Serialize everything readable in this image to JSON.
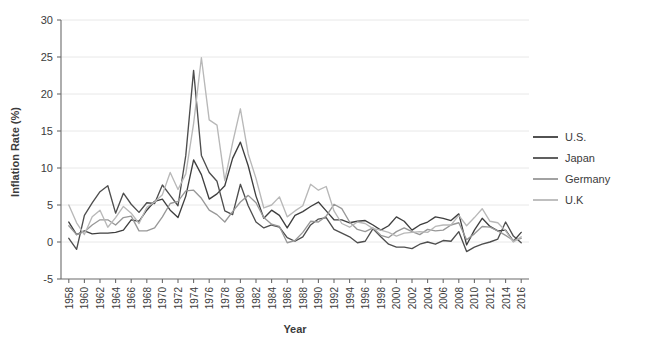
{
  "chart_data": {
    "type": "line",
    "title": "",
    "xlabel": "Year",
    "ylabel": "Inflation Rate (%)",
    "xlim": [
      1957,
      2017
    ],
    "ylim": [
      -5,
      30
    ],
    "grid": true,
    "legend_position": "right",
    "y_ticks": [
      -5,
      0,
      5,
      10,
      15,
      20,
      25,
      30
    ],
    "y_tick_labels": [
      "-5",
      "0",
      "5",
      "10",
      "15",
      "20",
      "25",
      "30"
    ],
    "x_ticks": [
      1958,
      1960,
      1962,
      1964,
      1966,
      1968,
      1970,
      1972,
      1974,
      1976,
      1978,
      1980,
      1982,
      1984,
      1986,
      1988,
      1990,
      1992,
      1994,
      1996,
      1998,
      2000,
      2002,
      2004,
      2006,
      2008,
      2010,
      2012,
      2014,
      2016
    ],
    "x_tick_labels": [
      "1958",
      "1960",
      "1962",
      "1964",
      "1966",
      "1968",
      "1970",
      "1972",
      "1974",
      "1976",
      "1978",
      "1980",
      "1982",
      "1984",
      "1986",
      "1988",
      "1990",
      "1992",
      "1994",
      "1996",
      "1998",
      "2000",
      "2002",
      "2004",
      "2006",
      "2008",
      "2010",
      "2012",
      "2014",
      "2016"
    ],
    "x": [
      1958,
      1959,
      1960,
      1961,
      1962,
      1963,
      1964,
      1965,
      1966,
      1967,
      1968,
      1969,
      1970,
      1971,
      1972,
      1973,
      1974,
      1975,
      1976,
      1977,
      1978,
      1979,
      1980,
      1981,
      1982,
      1983,
      1984,
      1985,
      1986,
      1987,
      1988,
      1989,
      1990,
      1991,
      1992,
      1993,
      1994,
      1995,
      1996,
      1997,
      1998,
      1999,
      2000,
      2001,
      2002,
      2003,
      2004,
      2005,
      2006,
      2007,
      2008,
      2009,
      2010,
      2011,
      2012,
      2013,
      2014,
      2015,
      2016
    ],
    "series": [
      {
        "name": "U.S.",
        "color": "#3f3f3f",
        "values": [
          2.7,
          1.0,
          1.5,
          1.1,
          1.2,
          1.2,
          1.3,
          1.6,
          3.0,
          2.8,
          4.3,
          5.5,
          5.8,
          4.3,
          3.3,
          6.2,
          11.1,
          9.1,
          5.8,
          6.5,
          7.6,
          11.3,
          13.5,
          10.3,
          6.2,
          3.2,
          4.3,
          3.6,
          1.9,
          3.6,
          4.1,
          4.8,
          5.4,
          4.2,
          3.0,
          3.0,
          2.6,
          2.8,
          2.9,
          2.3,
          1.6,
          2.2,
          3.4,
          2.8,
          1.6,
          2.3,
          2.7,
          3.4,
          3.2,
          2.9,
          3.8,
          -0.4,
          1.6,
          3.2,
          2.1,
          1.5,
          1.6,
          0.1,
          1.3
        ]
      },
      {
        "name": "Japan",
        "color": "#4e4e4e",
        "values": [
          0.5,
          -1.0,
          3.6,
          5.3,
          6.8,
          7.6,
          3.9,
          6.6,
          5.1,
          4.0,
          5.3,
          5.2,
          7.7,
          6.3,
          4.9,
          11.7,
          23.2,
          11.7,
          9.4,
          8.2,
          4.2,
          3.7,
          7.8,
          4.9,
          2.7,
          1.9,
          2.3,
          2.0,
          0.6,
          0.1,
          0.7,
          2.3,
          3.1,
          3.3,
          1.7,
          1.2,
          0.7,
          -0.1,
          0.1,
          1.8,
          0.7,
          -0.3,
          -0.7,
          -0.7,
          -0.9,
          -0.3,
          0.0,
          -0.3,
          0.2,
          0.1,
          1.4,
          -1.3,
          -0.7,
          -0.3,
          0.0,
          0.4,
          2.7,
          0.8,
          -0.1
        ]
      },
      {
        "name": "Germany",
        "color": "#989898",
        "values": [
          2.2,
          1.0,
          1.4,
          2.3,
          3.0,
          3.0,
          2.3,
          3.3,
          3.5,
          1.5,
          1.5,
          1.9,
          3.4,
          5.2,
          5.5,
          6.9,
          7.0,
          5.9,
          4.3,
          3.7,
          2.7,
          4.1,
          5.4,
          6.3,
          5.3,
          3.3,
          2.4,
          2.1,
          -0.1,
          0.2,
          1.3,
          2.8,
          2.7,
          3.5,
          5.1,
          4.5,
          2.7,
          1.7,
          1.4,
          1.9,
          0.9,
          0.6,
          1.4,
          1.9,
          1.4,
          1.0,
          1.7,
          1.5,
          1.6,
          2.3,
          2.6,
          0.3,
          1.1,
          2.1,
          2.0,
          1.5,
          0.9,
          0.2,
          0.5
        ]
      },
      {
        "name": "U.K",
        "color": "#b8b8b8",
        "values": [
          5.0,
          2.6,
          1.0,
          3.4,
          4.3,
          2.0,
          3.3,
          4.8,
          3.9,
          2.5,
          4.7,
          5.4,
          6.4,
          9.4,
          7.1,
          9.2,
          16.0,
          24.9,
          16.5,
          15.8,
          8.3,
          13.4,
          18.0,
          11.9,
          8.6,
          4.6,
          5.0,
          6.1,
          3.4,
          4.2,
          4.9,
          7.8,
          7.0,
          7.5,
          4.2,
          2.5,
          2.0,
          2.7,
          2.5,
          1.8,
          1.6,
          1.3,
          0.8,
          1.2,
          1.3,
          1.4,
          1.3,
          2.1,
          2.3,
          2.3,
          3.6,
          2.2,
          3.3,
          4.5,
          2.8,
          2.6,
          1.5,
          0.0,
          0.7
        ]
      }
    ]
  },
  "legend": {
    "items": [
      {
        "label": "U.S.",
        "color": "#3f3f3f"
      },
      {
        "label": "Japan",
        "color": "#4e4e4e"
      },
      {
        "label": "Germany",
        "color": "#989898"
      },
      {
        "label": "U.K",
        "color": "#b8b8b8"
      }
    ]
  }
}
